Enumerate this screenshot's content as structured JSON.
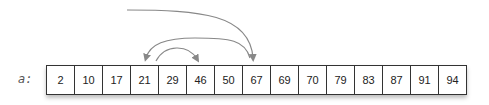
{
  "diagram": {
    "array_label": "a:",
    "values": [
      "2",
      "10",
      "17",
      "21",
      "29",
      "46",
      "50",
      "67",
      "69",
      "70",
      "79",
      "83",
      "87",
      "91",
      "94"
    ],
    "arrows": [
      {
        "from": "off-left-top",
        "to_index": 7,
        "description": "long arc ending at 67"
      },
      {
        "from_index": 7,
        "to_index": 3,
        "description": "arc from 67 back to 21"
      },
      {
        "from_index": 4,
        "to_index": 5,
        "description": "short arc from 29 to 46"
      }
    ],
    "colors": {
      "arrow": "#888888",
      "border": "#333333"
    }
  }
}
